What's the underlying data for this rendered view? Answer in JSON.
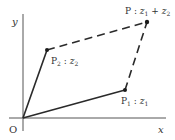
{
  "diagram": {
    "axes": {
      "x_label": "x",
      "y_label": "y",
      "origin_label": "O"
    },
    "points": {
      "p1": {
        "name": "P",
        "sub": "1",
        "sep": " : ",
        "var": "z",
        "var_sub": "1"
      },
      "p2": {
        "name": "P",
        "sub": "2",
        "sep": " : ",
        "var": "z",
        "var_sub": "2"
      },
      "p": {
        "name": "P",
        "sep": " : ",
        "var1": "z",
        "var1_sub": "1",
        "plus": " + ",
        "var2": "z",
        "var2_sub": "2"
      }
    },
    "colors": {
      "line": "#2a2a2a",
      "axis": "#555555",
      "text": "#333333"
    }
  }
}
